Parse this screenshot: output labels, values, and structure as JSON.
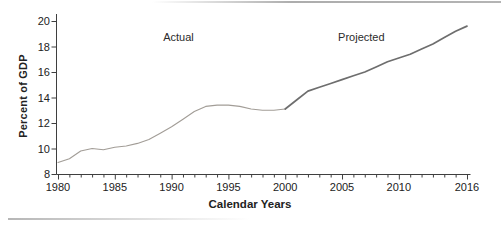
{
  "chart_data": {
    "type": "line",
    "title": "",
    "xlabel": "Calendar Years",
    "ylabel": "Percent of GDP",
    "xlim": [
      1980,
      2016
    ],
    "ylim": [
      8,
      20
    ],
    "x_ticks": [
      1980,
      1985,
      1990,
      1995,
      2000,
      2005,
      2010,
      2016
    ],
    "x_minor_tick_interval": 1,
    "y_ticks": [
      8,
      10,
      12,
      14,
      16,
      18,
      20
    ],
    "grid": false,
    "legend": "none",
    "annotations": [
      {
        "text": "Actual",
        "x": 1990.6,
        "y": 18.75
      },
      {
        "text": "Projected",
        "x": 2006.7,
        "y": 18.75
      }
    ],
    "series": [
      {
        "name": "Actual",
        "style": {
          "color": "#a29d97",
          "width": 1.1
        },
        "x": [
          1980,
          1981,
          1982,
          1983,
          1984,
          1985,
          1986,
          1987,
          1988,
          1989,
          1990,
          1991,
          1992,
          1993,
          1994,
          1995,
          1996,
          1997,
          1998,
          1999,
          2000
        ],
        "values": [
          8.9,
          9.2,
          9.8,
          10.0,
          9.9,
          10.1,
          10.2,
          10.4,
          10.7,
          11.2,
          11.7,
          12.3,
          12.9,
          13.3,
          13.4,
          13.4,
          13.3,
          13.1,
          13.0,
          13.0,
          13.1
        ]
      },
      {
        "name": "Projected",
        "style": {
          "color": "#6e6e6e",
          "width": 1.7
        },
        "x": [
          2000,
          2001,
          2002,
          2003,
          2004,
          2005,
          2006,
          2007,
          2008,
          2009,
          2010,
          2011,
          2012,
          2013,
          2014,
          2015,
          2016
        ],
        "values": [
          13.1,
          13.8,
          14.5,
          14.8,
          15.1,
          15.4,
          15.7,
          16.0,
          16.4,
          16.8,
          17.1,
          17.4,
          17.8,
          18.2,
          18.7,
          19.2,
          19.6
        ]
      }
    ]
  },
  "colors": {
    "axis": "#3f3f3f",
    "text": "#222222",
    "top_rule": "#b4b4b4",
    "bottom_rule": "#b6b6b6"
  }
}
